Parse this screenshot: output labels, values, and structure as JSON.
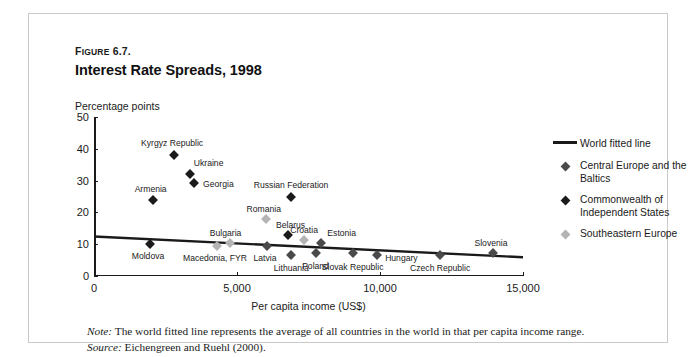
{
  "figure": {
    "number_prefix": "F",
    "number_smallcaps": "IGURE",
    "number_value": " 6.7.",
    "title": "Interest Rate Spreads, 1998"
  },
  "notes": {
    "note_label": "Note:",
    "note_text": " The world fitted line represents the average of all countries in the world in that per capita income range.",
    "source_label": "Source:",
    "source_text": " Eichengreen and Ruehl (2000)."
  },
  "legend": {
    "items": [
      {
        "label": "World fitted line",
        "marker": "line",
        "color": "#1a1a1a"
      },
      {
        "label": "Central Europe and the Baltics",
        "marker": "diamond",
        "color": "#4a4a4a"
      },
      {
        "label": "Commonwealth of Independent States",
        "marker": "diamond",
        "color": "#1b1b1b"
      },
      {
        "label": "Southeastern Europe",
        "marker": "diamond",
        "color": "#b4b4b4"
      }
    ]
  },
  "chart_data": {
    "type": "scatter",
    "title": "Interest Rate Spreads, 1998",
    "xlabel": "Per capita income (US$)",
    "ylabel": "Percentage points",
    "xlim": [
      0,
      15000
    ],
    "ylim": [
      0,
      50
    ],
    "xticks": [
      0,
      5000,
      10000,
      15000
    ],
    "xtick_labels": [
      "0",
      "5,000",
      "10,000",
      "15,000"
    ],
    "yticks": [
      0,
      10,
      20,
      30,
      40,
      50
    ],
    "ytick_labels": [
      "0",
      "10",
      "20",
      "30",
      "40",
      "50"
    ],
    "grid": false,
    "legend_position": "right",
    "series": [
      {
        "name": "Commonwealth of Independent States",
        "color": "#1b1b1b",
        "points": [
          {
            "label": "Kyrgyz Republic",
            "x": 2800,
            "y": 38.0,
            "label_dx": -2,
            "label_dy": -12,
            "label_anchor": "middle"
          },
          {
            "label": "Ukraine",
            "x": 3350,
            "y": 32.0,
            "label_dx": 4,
            "label_dy": -11,
            "label_anchor": "start"
          },
          {
            "label": "Georgia",
            "x": 3500,
            "y": 29.2,
            "label_dx": 9,
            "label_dy": 1,
            "label_anchor": "start"
          },
          {
            "label": "Armenia",
            "x": 2050,
            "y": 24.0,
            "label_dx": -2,
            "label_dy": -11,
            "label_anchor": "middle"
          },
          {
            "label": "Moldova",
            "x": 1950,
            "y": 10.0,
            "label_dx": -2,
            "label_dy": 12,
            "label_anchor": "middle"
          },
          {
            "label": "Russian Federation",
            "x": 6900,
            "y": 24.8,
            "label_dx": 0,
            "label_dy": -12,
            "label_anchor": "middle"
          },
          {
            "label": "Belarus",
            "x": 6800,
            "y": 13.0,
            "label_dx": 2,
            "label_dy": -10,
            "label_anchor": "middle"
          }
        ]
      },
      {
        "name": "Southeastern Europe",
        "color": "#b4b4b4",
        "points": [
          {
            "label": "Macedonia, FYR",
            "x": 4300,
            "y": 9.4,
            "label_dx": -2,
            "label_dy": 12,
            "label_anchor": "middle"
          },
          {
            "label": "Bulgaria",
            "x": 4750,
            "y": 10.4,
            "label_dx": -4,
            "label_dy": -10,
            "label_anchor": "middle"
          },
          {
            "label": "Romania",
            "x": 6000,
            "y": 18.0,
            "label_dx": -2,
            "label_dy": -10,
            "label_anchor": "middle"
          },
          {
            "label": "Croatia",
            "x": 7350,
            "y": 11.4,
            "label_dx": 0,
            "label_dy": -10,
            "label_anchor": "middle"
          }
        ]
      },
      {
        "name": "Central Europe and the Baltics",
        "color": "#4a4a4a",
        "points": [
          {
            "label": "Latvia",
            "x": 6050,
            "y": 9.4,
            "label_dx": -2,
            "label_dy": 12,
            "label_anchor": "middle"
          },
          {
            "label": "Lithuania",
            "x": 6900,
            "y": 6.6,
            "label_dx": 0,
            "label_dy": 13,
            "label_anchor": "middle"
          },
          {
            "label": "Poland",
            "x": 7750,
            "y": 7.3,
            "label_dx": 0,
            "label_dy": 13,
            "label_anchor": "middle"
          },
          {
            "label": "Estonia",
            "x": 7950,
            "y": 10.5,
            "label_dx": 6,
            "label_dy": -10,
            "label_anchor": "start"
          },
          {
            "label": "Slovak Republic",
            "x": 9050,
            "y": 7.3,
            "label_dx": 0,
            "label_dy": 14,
            "label_anchor": "middle"
          },
          {
            "label": "Hungary",
            "x": 9900,
            "y": 6.6,
            "label_dx": 8,
            "label_dy": 3,
            "label_anchor": "start"
          },
          {
            "label": "Czech Republic",
            "x": 12100,
            "y": 6.6,
            "label_dx": 0,
            "label_dy": 13,
            "label_anchor": "middle"
          },
          {
            "label": "Slovenia",
            "x": 13950,
            "y": 7.3,
            "label_dx": -2,
            "label_dy": -10,
            "label_anchor": "middle"
          }
        ]
      }
    ],
    "fitted_line": {
      "name": "World fitted line",
      "color": "#1a1a1a",
      "x": [
        0,
        15000
      ],
      "y": [
        12.4,
        5.9
      ]
    }
  }
}
